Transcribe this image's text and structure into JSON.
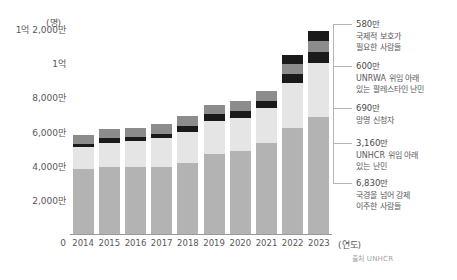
{
  "chart_data": {
    "type": "bar",
    "stacked": true,
    "title": "",
    "subtitle": "",
    "unit_label": "(명)",
    "xlabel": "(연도)",
    "ylabel": "",
    "grid": false,
    "legend_position": "right-callouts",
    "source": "출처 UNHCR",
    "categories": [
      "2014",
      "2015",
      "2016",
      "2017",
      "2018",
      "2019",
      "2020",
      "2021",
      "2022",
      "2023"
    ],
    "ylim": [
      0,
      120000000
    ],
    "ytick_labels": [
      "0",
      "2,000만",
      "4,000만",
      "6,000만",
      "8,000만",
      "1억",
      "1억 2,000만"
    ],
    "ytick_values": [
      0,
      20000000,
      40000000,
      60000000,
      80000000,
      100000000,
      120000000
    ],
    "series": [
      {
        "name": "국경을 넘어 강제 이주한 사람들",
        "color": "#b3b3b3",
        "values": [
          38000000,
          39000000,
          39500000,
          39500000,
          41500000,
          47000000,
          48500000,
          53500000,
          62000000,
          68300000
        ]
      },
      {
        "name": "UNHCR 위임 아래 있는 난민",
        "color": "#e5e5e5",
        "values": [
          13000000,
          14500000,
          15000000,
          16500000,
          18500000,
          19000000,
          19500000,
          20000000,
          26500000,
          31600000
        ]
      },
      {
        "name": "망명 신청자",
        "color": "#1a1a1a",
        "values": [
          1800000,
          2500000,
          2500000,
          2800000,
          3500000,
          4200000,
          4100000,
          4600000,
          5400000,
          6900000
        ]
      },
      {
        "name": "UNRWA 위임 아래 있는 팔레스타인 난민",
        "color": "#8c8c8c",
        "values": [
          5100000,
          5200000,
          5300000,
          5400000,
          5500000,
          5600000,
          5700000,
          5800000,
          5900000,
          6000000
        ]
      },
      {
        "name": "국제적 보호가 필요한 사람들",
        "color": "#1a1a1a",
        "values": [
          0,
          0,
          0,
          0,
          0,
          0,
          0,
          0,
          4800000,
          5800000
        ]
      }
    ],
    "callouts": [
      {
        "value": "580만",
        "desc_line1": "국제적 보호가",
        "desc_line2": "필요한 사람들",
        "anchor_y": 24
      },
      {
        "value": "600만",
        "desc_line1": "UNRWA 위임 아래",
        "desc_line2": "있는 팔레스타인 난민",
        "anchor_y": 66
      },
      {
        "value": "690만",
        "desc_line1": "망명 신청자",
        "desc_line2": "",
        "anchor_y": 108
      },
      {
        "value": "3,160만",
        "desc_line1": "UNHCR 위임 아래",
        "desc_line2": "있는 난민",
        "anchor_y": 143
      },
      {
        "value": "6,830만",
        "desc_line1": "국경을 넘어 강제",
        "desc_line2": "이주한 사람들",
        "anchor_y": 183
      }
    ]
  }
}
